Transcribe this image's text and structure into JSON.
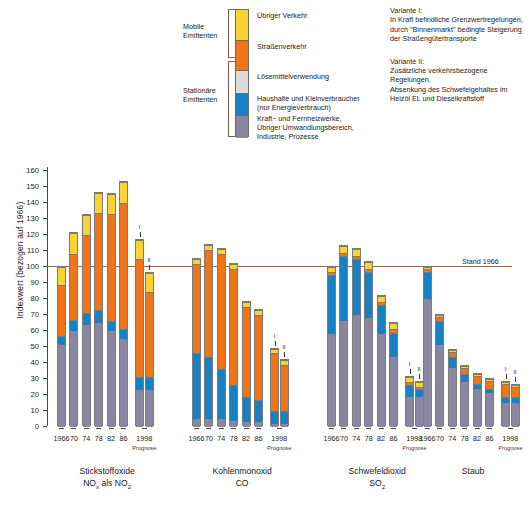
{
  "chart": {
    "type": "bar",
    "y_axis_title": "Indexwert (bezogen auf 1966)",
    "baseline_label": "Stand 1966",
    "baseline_value": 100,
    "ylim": [
      0,
      162
    ],
    "yticks": [
      0,
      10,
      20,
      30,
      40,
      50,
      60,
      70,
      80,
      90,
      100,
      110,
      120,
      130,
      140,
      150,
      160
    ],
    "prognose_note": "Prognose",
    "xlabels": [
      "1966",
      "70",
      "74",
      "78",
      "82",
      "86"
    ],
    "prognose_label": "1998",
    "variant_markers": [
      "I",
      "II"
    ]
  },
  "legend": {
    "groups": [
      {
        "name": "mobile",
        "line1": "Mobile",
        "line2": "Emittenten"
      },
      {
        "name": "stationaer",
        "line1": "Stationäre",
        "line2": "Emittenten"
      }
    ],
    "items": [
      {
        "key": "uebriger_verkehr",
        "color": "#f9d331",
        "label": "Übriger Verkehr"
      },
      {
        "key": "strassenverkehr",
        "color": "#ef7518",
        "label": "Straßenverkehr"
      },
      {
        "key": "loesemittel",
        "color": "#dcdcd4",
        "label": "Lösemittelverwendung"
      },
      {
        "key": "haushalte",
        "color": "#1681c4",
        "label": "Haushalte und Kleinverbraucher\n(nur Energieverbrauch)"
      },
      {
        "key": "kraftwerke",
        "color": "#8a85a0",
        "label": "Kraft− und Fernheizwerke,\nÜbriger Umwandlungsbereich,\nIndustrie, Prozesse"
      }
    ]
  },
  "variants": [
    {
      "title": "Variante I:",
      "lines": [
        "In Kraft befindliche Grenzwertregelungen,",
        "durch \"Binnenmarkt\" bedingte Steigerung",
        "der Straßengütertransporte"
      ]
    },
    {
      "title": "Variante II:",
      "lines": [
        "Zusätzliche verkehrsbezogene Regelungen,",
        "Absenkung des Schwefelgehaltes im",
        "Heizöl EL und Dieselkraftstoff"
      ]
    }
  ],
  "chart_data": {
    "type": "bar",
    "stacked": true,
    "title": "",
    "xlabel": "",
    "ylabel": "Indexwert (bezogen auf 1966)",
    "ylim": [
      0,
      162
    ],
    "grid": false,
    "legend_position": "top-center",
    "baseline": {
      "value": 100,
      "label": "Stand 1966"
    },
    "series_order": [
      "kraftwerke",
      "haushalte",
      "loesemittel",
      "strassenverkehr",
      "uebriger_verkehr"
    ],
    "series_colors": {
      "kraftwerke": "#8a85a0",
      "haushalte": "#1681c4",
      "loesemittel": "#dcdcd4",
      "strassenverkehr": "#ef7518",
      "uebriger_verkehr": "#f9d331"
    },
    "groups": [
      {
        "name": "Stickstoffoxide",
        "formula": "NOx als NO2",
        "label_line1": "Stickstoffoxide",
        "label_line2_main": "NO",
        "label_line2_sub1": "x",
        "label_line2_mid": " als NO",
        "label_line2_sub2": "2",
        "bars": [
          {
            "x": "1966",
            "variant": null,
            "total": 100,
            "segments": {
              "kraftwerke": 51,
              "haushalte": 6,
              "loesemittel": 0,
              "strassenverkehr": 32,
              "uebriger_verkehr": 11
            }
          },
          {
            "x": "70",
            "variant": null,
            "total": 121,
            "segments": {
              "kraftwerke": 60,
              "haushalte": 7,
              "loesemittel": 0,
              "strassenverkehr": 41,
              "uebriger_verkehr": 13
            }
          },
          {
            "x": "74",
            "variant": null,
            "total": 132.5,
            "segments": {
              "kraftwerke": 64,
              "haushalte": 7,
              "loesemittel": 0,
              "strassenverkehr": 49,
              "uebriger_verkehr": 12.5
            }
          },
          {
            "x": "78",
            "variant": null,
            "total": 146,
            "segments": {
              "kraftwerke": 65,
              "haushalte": 8,
              "loesemittel": 0,
              "strassenverkehr": 61,
              "uebriger_verkehr": 12
            }
          },
          {
            "x": "82",
            "variant": null,
            "total": 145.5,
            "segments": {
              "kraftwerke": 60,
              "haushalte": 6,
              "loesemittel": 0,
              "strassenverkehr": 67,
              "uebriger_verkehr": 12.5
            }
          },
          {
            "x": "86",
            "variant": null,
            "total": 153,
            "segments": {
              "kraftwerke": 55,
              "haushalte": 6,
              "loesemittel": 0,
              "strassenverkehr": 79,
              "uebriger_verkehr": 13
            }
          },
          {
            "x": "1998",
            "variant": "I",
            "total": 117,
            "segments": {
              "kraftwerke": 23,
              "haushalte": 8,
              "loesemittel": 0,
              "strassenverkehr": 74,
              "uebriger_verkehr": 12
            }
          },
          {
            "x": "1998",
            "variant": "II",
            "total": 96.5,
            "segments": {
              "kraftwerke": 23,
              "haushalte": 8,
              "loesemittel": 0,
              "strassenverkehr": 53.5,
              "uebriger_verkehr": 12
            }
          }
        ]
      },
      {
        "name": "Kohlenmonoxid",
        "formula": "CO",
        "label_line1": "Kohlenmonoxid",
        "label_line2_main": "CO",
        "label_line2_sub1": "",
        "label_line2_mid": "",
        "label_line2_sub2": "",
        "bars": [
          {
            "x": "1966",
            "variant": null,
            "total": 105,
            "segments": {
              "kraftwerke": 5,
              "haushalte": 41,
              "loesemittel": 0,
              "strassenverkehr": 56,
              "uebriger_verkehr": 3
            }
          },
          {
            "x": "70",
            "variant": null,
            "total": 113.5,
            "segments": {
              "kraftwerke": 5,
              "haushalte": 39,
              "loesemittel": 0,
              "strassenverkehr": 66.5,
              "uebriger_verkehr": 3
            }
          },
          {
            "x": "74",
            "variant": null,
            "total": 111,
            "segments": {
              "kraftwerke": 5,
              "haushalte": 31,
              "loesemittel": 0,
              "strassenverkehr": 72,
              "uebriger_verkehr": 3
            }
          },
          {
            "x": "78",
            "variant": null,
            "total": 102,
            "segments": {
              "kraftwerke": 4,
              "haushalte": 22,
              "loesemittel": 0,
              "strassenverkehr": 73,
              "uebriger_verkehr": 3
            }
          },
          {
            "x": "82",
            "variant": null,
            "total": 78,
            "segments": {
              "kraftwerke": 3,
              "haushalte": 16,
              "loesemittel": 0,
              "strassenverkehr": 56,
              "uebriger_verkehr": 3
            }
          },
          {
            "x": "86",
            "variant": null,
            "total": 73,
            "segments": {
              "kraftwerke": 3,
              "haushalte": 14,
              "loesemittel": 0,
              "strassenverkehr": 53,
              "uebriger_verkehr": 3
            }
          },
          {
            "x": "1998",
            "variant": "I",
            "total": 49,
            "segments": {
              "kraftwerke": 2,
              "haushalte": 8,
              "loesemittel": 0,
              "strassenverkehr": 36,
              "uebriger_verkehr": 3
            }
          },
          {
            "x": "1998",
            "variant": "II",
            "total": 42,
            "segments": {
              "kraftwerke": 2,
              "haushalte": 8,
              "loesemittel": 0,
              "strassenverkehr": 29,
              "uebriger_verkehr": 3
            }
          }
        ]
      },
      {
        "name": "Schwefeldioxid",
        "formula": "SO2",
        "label_line1": "Schwefeldioxid",
        "label_line2_main": "SO",
        "label_line2_sub1": "2",
        "label_line2_mid": "",
        "label_line2_sub2": "",
        "bars": [
          {
            "x": "1966",
            "variant": null,
            "total": 100,
            "segments": {
              "kraftwerke": 58,
              "haushalte": 37,
              "loesemittel": 0,
              "strassenverkehr": 2,
              "uebriger_verkehr": 3
            }
          },
          {
            "x": "70",
            "variant": null,
            "total": 113,
            "segments": {
              "kraftwerke": 66,
              "haushalte": 41,
              "loesemittel": 0,
              "strassenverkehr": 2,
              "uebriger_verkehr": 4
            }
          },
          {
            "x": "74",
            "variant": null,
            "total": 111,
            "segments": {
              "kraftwerke": 70,
              "haushalte": 35,
              "loesemittel": 0,
              "strassenverkehr": 2,
              "uebriger_verkehr": 4
            }
          },
          {
            "x": "78",
            "variant": null,
            "total": 103,
            "segments": {
              "kraftwerke": 68,
              "haushalte": 29,
              "loesemittel": 0,
              "strassenverkehr": 2,
              "uebriger_verkehr": 4
            }
          },
          {
            "x": "82",
            "variant": null,
            "total": 82,
            "segments": {
              "kraftwerke": 58,
              "haushalte": 18,
              "loesemittel": 0,
              "strassenverkehr": 2,
              "uebriger_verkehr": 4
            }
          },
          {
            "x": "86",
            "variant": null,
            "total": 65,
            "segments": {
              "kraftwerke": 44,
              "haushalte": 15,
              "loesemittel": 0,
              "strassenverkehr": 2,
              "uebriger_verkehr": 4
            }
          },
          {
            "x": "1998",
            "variant": "I",
            "total": 31,
            "segments": {
              "kraftwerke": 19,
              "haushalte": 7,
              "loesemittel": 0,
              "strassenverkehr": 2,
              "uebriger_verkehr": 3
            }
          },
          {
            "x": "1998",
            "variant": "II",
            "total": 28,
            "segments": {
              "kraftwerke": 19,
              "haushalte": 5,
              "loesemittel": 0,
              "strassenverkehr": 1,
              "uebriger_verkehr": 3
            }
          }
        ]
      },
      {
        "name": "Staub",
        "formula": "",
        "label_line1": "Staub",
        "label_line2_main": "",
        "label_line2_sub1": "",
        "label_line2_mid": "",
        "label_line2_sub2": "",
        "bars": [
          {
            "x": "1966",
            "variant": null,
            "total": 100,
            "segments": {
              "kraftwerke": 80,
              "haushalte": 17,
              "loesemittel": 0,
              "strassenverkehr": 2,
              "uebriger_verkehr": 1
            }
          },
          {
            "x": "70",
            "variant": null,
            "total": 70,
            "segments": {
              "kraftwerke": 51,
              "haushalte": 15,
              "loesemittel": 0,
              "strassenverkehr": 3,
              "uebriger_verkehr": 1
            }
          },
          {
            "x": "74",
            "variant": null,
            "total": 48,
            "segments": {
              "kraftwerke": 37,
              "haushalte": 7,
              "loesemittel": 0,
              "strassenverkehr": 3,
              "uebriger_verkehr": 1
            }
          },
          {
            "x": "78",
            "variant": null,
            "total": 38,
            "segments": {
              "kraftwerke": 28,
              "haushalte": 5,
              "loesemittel": 0,
              "strassenverkehr": 4,
              "uebriger_verkehr": 1
            }
          },
          {
            "x": "82",
            "variant": null,
            "total": 33,
            "segments": {
              "kraftwerke": 24,
              "haushalte": 3,
              "loesemittel": 0,
              "strassenverkehr": 5,
              "uebriger_verkehr": 1
            }
          },
          {
            "x": "86",
            "variant": null,
            "total": 30,
            "segments": {
              "kraftwerke": 21,
              "haushalte": 3,
              "loesemittel": 0,
              "strassenverkehr": 5,
              "uebriger_verkehr": 1
            }
          },
          {
            "x": "1998",
            "variant": "I",
            "total": 28,
            "segments": {
              "kraftwerke": 15,
              "haushalte": 4,
              "loesemittel": 0,
              "strassenverkehr": 8,
              "uebriger_verkehr": 1
            }
          },
          {
            "x": "1998",
            "variant": "II",
            "total": 26,
            "segments": {
              "kraftwerke": 15,
              "haushalte": 4,
              "loesemittel": 0,
              "strassenverkehr": 6,
              "uebriger_verkehr": 1
            }
          }
        ]
      }
    ]
  }
}
